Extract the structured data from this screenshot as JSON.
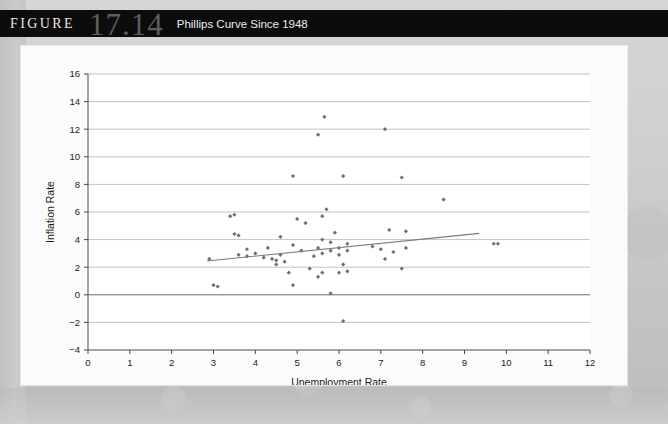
{
  "header": {
    "figure_word": "FIGURE",
    "figure_number": "17.14",
    "caption": "Phillips Curve Since 1948"
  },
  "colors": {
    "title_bar_bg": "#0c0c0c",
    "figure_number": "#5d5d5d",
    "caption_text": "#ececec",
    "card_bg": "#fbfbfb",
    "point": "#6e6e78",
    "trend_line": "#7a7a82",
    "grid": "#c3c3c3",
    "axis": "#4a4a4a",
    "page_bg": "#cfcfcf"
  },
  "chart_data": {
    "type": "scatter",
    "title": "Phillips Curve Since 1948",
    "xlabel": "Unemployment Rate",
    "ylabel": "Inflation Rate",
    "xlim": [
      0,
      12
    ],
    "ylim": [
      -4,
      16
    ],
    "xticks": [
      0,
      1,
      2,
      3,
      4,
      5,
      6,
      7,
      8,
      9,
      10,
      11,
      12
    ],
    "yticks": [
      -4,
      -2,
      0,
      2,
      4,
      6,
      8,
      10,
      12,
      14,
      16
    ],
    "grid": "horizontal",
    "legend": "none",
    "series": [
      {
        "name": "Annual observations",
        "marker": "diamond",
        "points": [
          [
            2.9,
            2.6
          ],
          [
            3.0,
            0.7
          ],
          [
            3.1,
            0.6
          ],
          [
            3.4,
            5.7
          ],
          [
            3.5,
            5.8
          ],
          [
            3.5,
            4.4
          ],
          [
            3.6,
            4.3
          ],
          [
            3.6,
            2.9
          ],
          [
            3.8,
            3.3
          ],
          [
            3.8,
            2.8
          ],
          [
            4.0,
            3.0
          ],
          [
            4.2,
            2.7
          ],
          [
            4.3,
            3.4
          ],
          [
            4.4,
            2.6
          ],
          [
            4.5,
            2.5
          ],
          [
            4.5,
            2.2
          ],
          [
            4.6,
            4.2
          ],
          [
            4.6,
            2.9
          ],
          [
            4.7,
            2.4
          ],
          [
            4.8,
            1.6
          ],
          [
            4.9,
            8.6
          ],
          [
            4.9,
            3.6
          ],
          [
            4.9,
            0.7
          ],
          [
            5.0,
            5.5
          ],
          [
            5.1,
            3.2
          ],
          [
            5.2,
            5.2
          ],
          [
            5.3,
            1.9
          ],
          [
            5.4,
            2.8
          ],
          [
            5.5,
            11.6
          ],
          [
            5.5,
            3.4
          ],
          [
            5.5,
            1.3
          ],
          [
            5.6,
            5.7
          ],
          [
            5.6,
            4.0
          ],
          [
            5.6,
            3.0
          ],
          [
            5.6,
            1.6
          ],
          [
            5.65,
            12.9
          ],
          [
            5.7,
            6.2
          ],
          [
            5.8,
            3.8
          ],
          [
            5.8,
            3.2
          ],
          [
            5.8,
            0.1
          ],
          [
            5.9,
            4.5
          ],
          [
            6.0,
            3.4
          ],
          [
            6.0,
            2.9
          ],
          [
            6.0,
            1.6
          ],
          [
            6.1,
            8.6
          ],
          [
            6.1,
            2.2
          ],
          [
            6.1,
            -1.9
          ],
          [
            6.2,
            3.7
          ],
          [
            6.2,
            3.2
          ],
          [
            6.2,
            1.7
          ],
          [
            6.8,
            3.5
          ],
          [
            7.0,
            3.3
          ],
          [
            7.1,
            12.0
          ],
          [
            7.1,
            2.6
          ],
          [
            7.2,
            4.7
          ],
          [
            7.3,
            3.1
          ],
          [
            7.5,
            1.9
          ],
          [
            7.5,
            8.5
          ],
          [
            7.6,
            4.6
          ],
          [
            7.6,
            3.4
          ],
          [
            8.5,
            6.9
          ],
          [
            9.7,
            3.7
          ],
          [
            9.8,
            3.7
          ]
        ]
      }
    ],
    "trend_line": {
      "name": "Fitted regression line",
      "x_start": 2.85,
      "y_start": 2.45,
      "x_end": 9.35,
      "y_end": 4.45
    }
  }
}
